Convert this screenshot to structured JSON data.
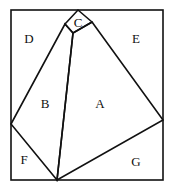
{
  "diagram": {
    "regions": [
      {
        "id": "A",
        "label": "A",
        "x": 100,
        "y": 108
      },
      {
        "id": "B",
        "label": "B",
        "x": 45,
        "y": 108
      },
      {
        "id": "C",
        "label": "C",
        "x": 78,
        "y": 27
      },
      {
        "id": "D",
        "label": "D",
        "x": 29,
        "y": 43
      },
      {
        "id": "E",
        "label": "E",
        "x": 136,
        "y": 43
      },
      {
        "id": "F",
        "label": "F",
        "x": 24,
        "y": 164
      },
      {
        "id": "G",
        "label": "G",
        "x": 136,
        "y": 166
      }
    ],
    "stroke_color": "#111111"
  }
}
